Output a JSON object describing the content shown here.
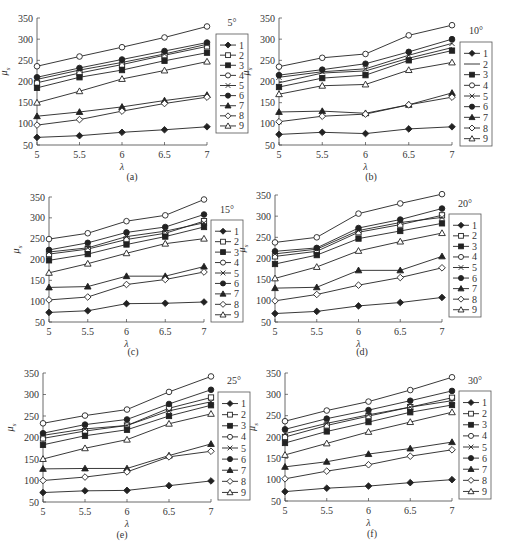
{
  "figure": {
    "ylabel": "μ_s",
    "xlabel": "λ",
    "legend_labels": [
      "1",
      "2",
      "3",
      "4",
      "5",
      "6",
      "7",
      "8",
      "9"
    ]
  },
  "chart_data": [
    {
      "type": "line",
      "panel": "(a)",
      "angle": "5°",
      "x": [
        5,
        5.5,
        6,
        6.5,
        7
      ],
      "xlabel": "λ",
      "ylabel": "μ_s",
      "ylim": [
        50,
        350
      ],
      "xticks": [
        "5",
        "5.5",
        "6",
        "6.5",
        "7"
      ],
      "yticks": [
        50,
        100,
        150,
        200,
        250,
        300,
        350
      ],
      "grid": false,
      "legend_position": "right",
      "series": [
        {
          "name": "1",
          "marker": "diamond-filled",
          "values": [
            68,
            72,
            80,
            86,
            93
          ]
        },
        {
          "name": "2",
          "marker": "square-open",
          "values": [
            197,
            220,
            240,
            262,
            283
          ]
        },
        {
          "name": "3",
          "marker": "square-filled",
          "values": [
            185,
            210,
            227,
            249,
            268
          ]
        },
        {
          "name": "4",
          "marker": "circle-open",
          "values": [
            236,
            259,
            281,
            304,
            330
          ]
        },
        {
          "name": "5",
          "marker": "x",
          "values": [
            205,
            227,
            245,
            265,
            288
          ]
        },
        {
          "name": "6",
          "marker": "circle-filled",
          "values": [
            210,
            232,
            252,
            272,
            292
          ]
        },
        {
          "name": "7",
          "marker": "triangle-filled",
          "values": [
            118,
            128,
            140,
            155,
            168
          ]
        },
        {
          "name": "8",
          "marker": "diamond-open",
          "values": [
            97,
            110,
            130,
            148,
            163
          ]
        },
        {
          "name": "9",
          "marker": "triangle-open",
          "values": [
            150,
            177,
            206,
            226,
            247
          ]
        }
      ]
    },
    {
      "type": "line",
      "panel": "(b)",
      "angle": "10°",
      "x": [
        5,
        5.5,
        6,
        6.5,
        7
      ],
      "xlabel": "λ",
      "ylabel": "μ_s",
      "ylim": [
        50,
        350
      ],
      "xticks": [
        "5",
        "5.5",
        "6",
        "6.5",
        "7"
      ],
      "yticks": [
        50,
        100,
        150,
        200,
        250,
        300,
        350
      ],
      "grid": false,
      "legend_position": "right",
      "series": [
        {
          "name": "1",
          "marker": "diamond-filled",
          "values": [
            75,
            80,
            77,
            88,
            93
          ]
        },
        {
          "name": "2",
          "marker": "line",
          "values": [
            197,
            220,
            225,
            255,
            280
          ]
        },
        {
          "name": "3",
          "marker": "square-filled",
          "values": [
            187,
            208,
            215,
            250,
            273
          ]
        },
        {
          "name": "4",
          "marker": "circle-open",
          "values": [
            235,
            256,
            265,
            309,
            333
          ]
        },
        {
          "name": "5",
          "marker": "x",
          "values": [
            210,
            223,
            230,
            262,
            290
          ]
        },
        {
          "name": "6",
          "marker": "circle-filled",
          "values": [
            215,
            228,
            242,
            270,
            300
          ]
        },
        {
          "name": "7",
          "marker": "triangle-filled",
          "values": [
            128,
            130,
            125,
            145,
            173
          ]
        },
        {
          "name": "8",
          "marker": "diamond-open",
          "values": [
            105,
            118,
            123,
            145,
            163
          ]
        },
        {
          "name": "9",
          "marker": "triangle-open",
          "values": [
            170,
            190,
            193,
            227,
            245
          ]
        }
      ]
    },
    {
      "type": "line",
      "panel": "(c)",
      "angle": "15°",
      "x": [
        5,
        5.5,
        6,
        6.5,
        7
      ],
      "xlabel": "λ",
      "ylabel": "μ_s",
      "ylim": [
        50,
        350
      ],
      "xticks": [
        "5",
        "5.5",
        "6",
        "6.5",
        "7"
      ],
      "yticks": [
        50,
        100,
        150,
        200,
        250,
        300,
        350
      ],
      "grid": false,
      "legend_position": "right",
      "series": [
        {
          "name": "1",
          "marker": "diamond-filled",
          "values": [
            73,
            77,
            94,
            95,
            98
          ]
        },
        {
          "name": "2",
          "marker": "square-open",
          "values": [
            213,
            225,
            248,
            263,
            292
          ]
        },
        {
          "name": "3",
          "marker": "square-filled",
          "values": [
            198,
            213,
            236,
            255,
            278
          ]
        },
        {
          "name": "4",
          "marker": "circle-open",
          "values": [
            249,
            263,
            292,
            306,
            344
          ]
        },
        {
          "name": "5",
          "marker": "x",
          "values": [
            218,
            228,
            255,
            268,
            288
          ]
        },
        {
          "name": "6",
          "marker": "circle-filled",
          "values": [
            223,
            240,
            265,
            278,
            308
          ]
        },
        {
          "name": "7",
          "marker": "triangle-filled",
          "values": [
            133,
            135,
            160,
            160,
            183
          ]
        },
        {
          "name": "8",
          "marker": "diamond-open",
          "values": [
            103,
            110,
            140,
            152,
            170
          ]
        },
        {
          "name": "9",
          "marker": "triangle-open",
          "values": [
            168,
            190,
            215,
            238,
            250
          ]
        }
      ]
    },
    {
      "type": "line",
      "panel": "(d)",
      "angle": "20°",
      "x": [
        5,
        5.5,
        6,
        6.5,
        7
      ],
      "xlabel": "λ",
      "ylabel": "μ_s",
      "ylim": [
        50,
        350
      ],
      "xticks": [
        "5",
        "5.5",
        "6",
        "6.5",
        "7"
      ],
      "yticks": [
        50,
        100,
        150,
        200,
        250,
        300,
        350
      ],
      "grid": false,
      "legend_position": "right",
      "series": [
        {
          "name": "1",
          "marker": "diamond-filled",
          "values": [
            70,
            75,
            88,
            96,
            108
          ]
        },
        {
          "name": "2",
          "marker": "square-open",
          "values": [
            205,
            217,
            262,
            280,
            302
          ]
        },
        {
          "name": "3",
          "marker": "square-filled",
          "values": [
            187,
            208,
            247,
            265,
            283
          ]
        },
        {
          "name": "4",
          "marker": "circle-open",
          "values": [
            238,
            250,
            306,
            330,
            352
          ]
        },
        {
          "name": "5",
          "marker": "x",
          "values": [
            211,
            222,
            266,
            285,
            297
          ]
        },
        {
          "name": "6",
          "marker": "circle-filled",
          "values": [
            217,
            225,
            272,
            292,
            318
          ]
        },
        {
          "name": "7",
          "marker": "triangle-filled",
          "values": [
            130,
            132,
            172,
            172,
            205
          ]
        },
        {
          "name": "8",
          "marker": "diamond-open",
          "values": [
            100,
            115,
            137,
            155,
            178
          ]
        },
        {
          "name": "9",
          "marker": "triangle-open",
          "values": [
            153,
            180,
            218,
            240,
            260
          ]
        }
      ]
    },
    {
      "type": "line",
      "panel": "(e)",
      "angle": "25°",
      "x": [
        5,
        5.5,
        6,
        6.5,
        7
      ],
      "xlabel": "λ",
      "ylabel": "μ_s",
      "ylim": [
        50,
        350
      ],
      "xticks": [
        "5",
        "5.5",
        "6",
        "6.5",
        "7"
      ],
      "yticks": [
        50,
        100,
        150,
        200,
        250,
        300,
        350
      ],
      "grid": false,
      "legend_position": "right",
      "series": [
        {
          "name": "1",
          "marker": "diamond-filled",
          "values": [
            72,
            76,
            77,
            88,
            99
          ]
        },
        {
          "name": "2",
          "marker": "square-open",
          "values": [
            198,
            215,
            228,
            268,
            293
          ]
        },
        {
          "name": "3",
          "marker": "square-filled",
          "values": [
            183,
            204,
            218,
            250,
            275
          ]
        },
        {
          "name": "4",
          "marker": "circle-open",
          "values": [
            233,
            251,
            265,
            306,
            342
          ]
        },
        {
          "name": "5",
          "marker": "x",
          "values": [
            205,
            220,
            228,
            262,
            283
          ]
        },
        {
          "name": "6",
          "marker": "circle-filled",
          "values": [
            210,
            230,
            242,
            278,
            311
          ]
        },
        {
          "name": "7",
          "marker": "triangle-filled",
          "values": [
            127,
            128,
            128,
            158,
            185
          ]
        },
        {
          "name": "8",
          "marker": "diamond-open",
          "values": [
            100,
            108,
            120,
            155,
            168
          ]
        },
        {
          "name": "9",
          "marker": "triangle-open",
          "values": [
            150,
            175,
            195,
            232,
            255
          ]
        }
      ]
    },
    {
      "type": "line",
      "panel": "(f)",
      "angle": "30°",
      "x": [
        5,
        5.5,
        6,
        6.5,
        7
      ],
      "xlabel": "λ",
      "ylabel": "μ_s",
      "ylim": [
        50,
        350
      ],
      "xticks": [
        "5",
        "5.5",
        "6",
        "6.5",
        "7"
      ],
      "yticks": [
        50,
        100,
        150,
        200,
        250,
        300,
        350
      ],
      "grid": false,
      "legend_position": "right",
      "series": [
        {
          "name": "1",
          "marker": "diamond-filled",
          "values": [
            72,
            80,
            85,
            93,
            100
          ]
        },
        {
          "name": "2",
          "marker": "square-open",
          "values": [
            200,
            227,
            249,
            270,
            292
          ]
        },
        {
          "name": "3",
          "marker": "square-filled",
          "values": [
            186,
            213,
            235,
            258,
            275
          ]
        },
        {
          "name": "4",
          "marker": "circle-open",
          "values": [
            237,
            262,
            283,
            310,
            340
          ]
        },
        {
          "name": "5",
          "marker": "x",
          "values": [
            208,
            232,
            252,
            270,
            285
          ]
        },
        {
          "name": "6",
          "marker": "circle-filled",
          "values": [
            218,
            243,
            263,
            285,
            308
          ]
        },
        {
          "name": "7",
          "marker": "triangle-filled",
          "values": [
            130,
            142,
            160,
            173,
            188
          ]
        },
        {
          "name": "8",
          "marker": "diamond-open",
          "values": [
            102,
            120,
            135,
            155,
            170
          ]
        },
        {
          "name": "9",
          "marker": "triangle-open",
          "values": [
            158,
            185,
            212,
            235,
            258
          ]
        }
      ]
    }
  ]
}
